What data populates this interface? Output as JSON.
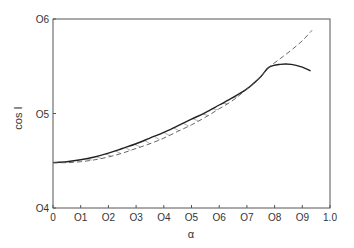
{
  "chart_data": {
    "type": "line",
    "title": "",
    "xlabel": "α",
    "ylabel": "cos I",
    "xlim": [
      0,
      1.0
    ],
    "ylim": [
      0.4,
      0.6
    ],
    "grid": false,
    "legend": null,
    "x_ticks": [
      "0",
      "0.1",
      "0.2",
      "0.3",
      "0.4",
      "0.5",
      "0.6",
      "0.7",
      "0.8",
      "0.9",
      "1.0"
    ],
    "x_tick_labels": [
      "0",
      "O1",
      "O2",
      "O3",
      "O4",
      "O5",
      "O6",
      "O7",
      "O8",
      "O9",
      "1.0"
    ],
    "y_ticks": [
      0.4,
      0.5,
      0.6
    ],
    "y_tick_labels": [
      "O4",
      "O5",
      "O6"
    ],
    "series": [
      {
        "name": "solid curve",
        "style": "solid",
        "x": [
          0.0,
          0.05,
          0.1,
          0.15,
          0.2,
          0.25,
          0.3,
          0.35,
          0.4,
          0.45,
          0.5,
          0.55,
          0.6,
          0.65,
          0.7,
          0.75,
          0.78,
          0.82,
          0.86,
          0.9,
          0.93
        ],
        "y": [
          0.448,
          0.449,
          0.451,
          0.454,
          0.458,
          0.463,
          0.468,
          0.474,
          0.48,
          0.487,
          0.494,
          0.501,
          0.509,
          0.517,
          0.526,
          0.539,
          0.549,
          0.552,
          0.552,
          0.549,
          0.545
        ]
      },
      {
        "name": "dashed curve",
        "style": "dashed",
        "x": [
          0.0,
          0.05,
          0.1,
          0.15,
          0.2,
          0.25,
          0.3,
          0.35,
          0.4,
          0.45,
          0.5,
          0.55,
          0.6,
          0.65,
          0.7,
          0.75,
          0.78,
          0.82,
          0.86,
          0.9,
          0.935
        ],
        "y": [
          0.448,
          0.448,
          0.449,
          0.451,
          0.454,
          0.458,
          0.463,
          0.468,
          0.474,
          0.481,
          0.488,
          0.496,
          0.505,
          0.514,
          0.526,
          0.539,
          0.549,
          0.558,
          0.567,
          0.577,
          0.588
        ]
      }
    ],
    "annotations": [
      "hatched region between solid and dashed curves for α ≈ 0.1–0.78"
    ]
  }
}
